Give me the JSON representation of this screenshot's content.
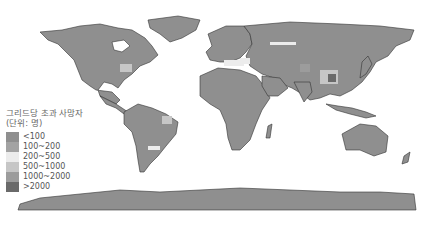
{
  "legend": {
    "title": "그리드당 초과 사망자",
    "unit": "(단위: 명)",
    "items": [
      {
        "label": "<100",
        "color": "#8f8f8f"
      },
      {
        "label": "100~200",
        "color": "#a3a3a3"
      },
      {
        "label": "200~500",
        "color": "#ececec"
      },
      {
        "label": "500~1000",
        "color": "#c6c6c6"
      },
      {
        "label": "1000~2000",
        "color": "#9c9c9c"
      },
      {
        "label": ">2000",
        "color": "#6a6a6a"
      }
    ]
  },
  "map": {
    "land_color": "#8f8f8f",
    "border_color": "#333333",
    "ocean_color": "#ffffff"
  }
}
